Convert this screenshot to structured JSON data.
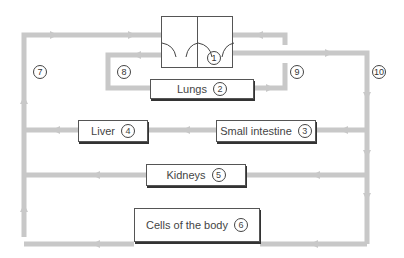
{
  "heart": {
    "number": "1"
  },
  "organs": {
    "lungs": {
      "label": "Lungs",
      "number": "2"
    },
    "small_intestine": {
      "label": "Small intestine",
      "number": "3"
    },
    "liver": {
      "label": "Liver",
      "number": "4"
    },
    "kidneys": {
      "label": "Kidneys",
      "number": "5"
    },
    "cells": {
      "label": "Cells of the body",
      "number": "6"
    }
  },
  "vessels": [
    {
      "number": "7"
    },
    {
      "number": "8"
    },
    {
      "number": "9"
    },
    {
      "number": "10"
    }
  ],
  "colors": {
    "vessel": "#c8c8c8",
    "box_border": "#555555"
  }
}
